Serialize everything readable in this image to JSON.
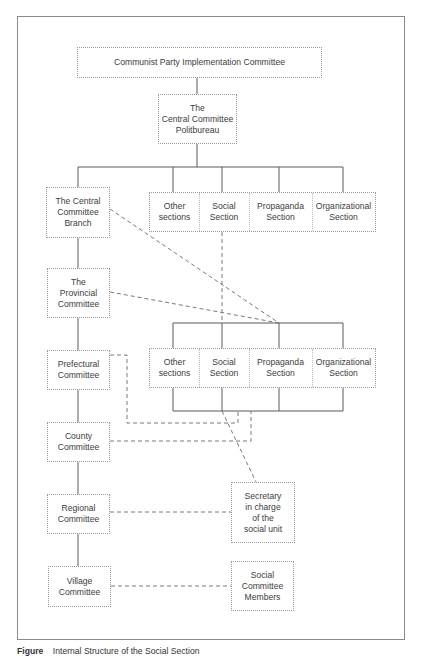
{
  "diagram": {
    "top": "Communist Party Implementation Committee",
    "politbureau": "The\nCentral Committee\nPolitbureau",
    "hierarchy": [
      {
        "id": "branch",
        "label": "The Central\nCommittee\nBranch"
      },
      {
        "id": "provincial",
        "label": "The\nProvincial\nCommittee"
      },
      {
        "id": "prefectural",
        "label": "Prefectural\nCommittee"
      },
      {
        "id": "county",
        "label": "County\nCommittee"
      },
      {
        "id": "regional",
        "label": "Regional\nCommittee"
      },
      {
        "id": "village",
        "label": "Village\nCommittee"
      }
    ],
    "upper_sections": [
      "Other\nsections",
      "Social\nSection",
      "Propaganda\nSection",
      "Organizational\nSection"
    ],
    "lower_sections": [
      "Other\nsections",
      "Social\nSection",
      "Propaganda\nSection",
      "Organizational\nSection"
    ],
    "secretary": "Secretary\nin charge\nof the\nsocial unit",
    "members": "Social\nCommittee\nMembers",
    "colors": {
      "solid_line": "#5a5a5a",
      "dashed_line": "#6a6a6a",
      "box_border": "#9a9a9a"
    }
  },
  "caption": {
    "label": "Figure",
    "text": "Internal Structure of the Social Section"
  }
}
